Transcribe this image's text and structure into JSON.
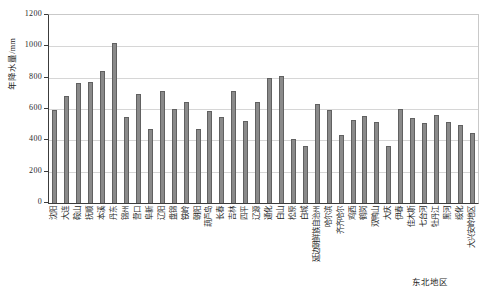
{
  "chart_data": {
    "type": "bar",
    "title": "",
    "ylabel": "年降水量/mm",
    "xlabel": "",
    "region_label": "东北地区",
    "ylim": [
      0,
      1200
    ],
    "ytick_step": 200,
    "yticks": [
      0,
      200,
      400,
      600,
      800,
      1000,
      1200
    ],
    "grid": true,
    "legend": "none",
    "categories": [
      "沈阳",
      "大连",
      "鞍山",
      "抚顺",
      "本溪",
      "丹东",
      "锦州",
      "营口",
      "阜新",
      "辽阳",
      "盘锦",
      "铁岭",
      "朝阳",
      "葫芦岛",
      "长春",
      "吉林",
      "四平",
      "辽源",
      "通化",
      "白山",
      "松原",
      "白城",
      "延边朝鲜族自治州",
      "哈尔滨",
      "齐齐哈尔",
      "鸡西",
      "鹤岗",
      "双鸭山",
      "大庆",
      "伊春",
      "佳木斯",
      "七台河",
      "牡丹江",
      "黑河",
      "绥化",
      "大兴安岭地区"
    ],
    "values": [
      595,
      685,
      765,
      775,
      845,
      1020,
      550,
      695,
      470,
      715,
      600,
      645,
      470,
      590,
      550,
      715,
      525,
      645,
      800,
      810,
      410,
      365,
      630,
      595,
      435,
      530,
      555,
      520,
      365,
      600,
      540,
      510,
      560,
      515,
      500,
      450
    ],
    "colors": {
      "bar_fill": "#8a8a8a",
      "bar_border": "#616161",
      "gridline": "#d6d6d6",
      "axis": "#3c3c3c",
      "plot_border": "#c9c9c9",
      "text": "#1f1f1f",
      "background": "#ffffff"
    }
  }
}
